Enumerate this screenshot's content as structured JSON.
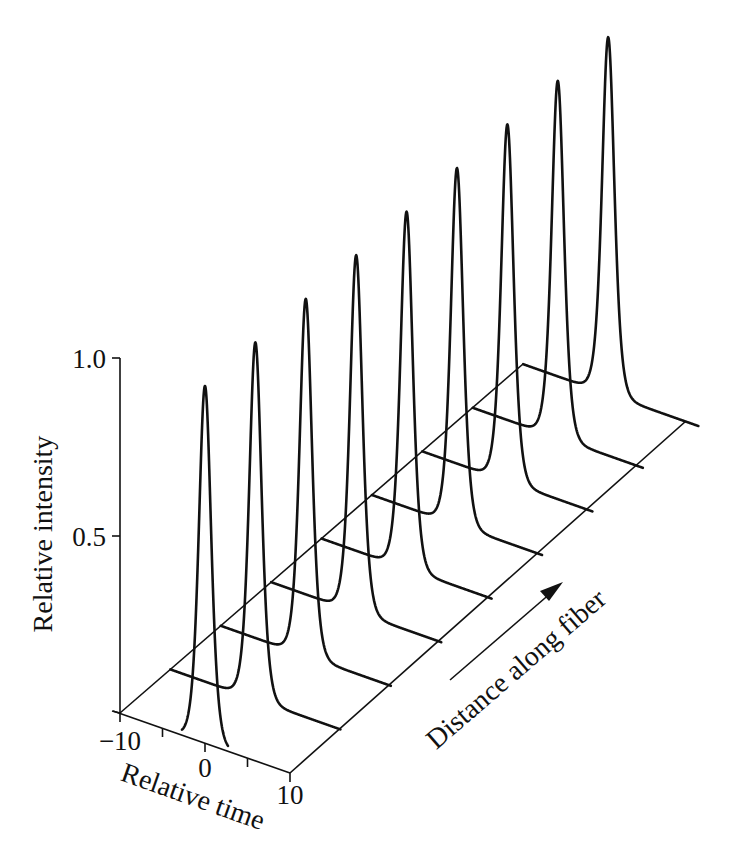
{
  "figure": {
    "y_axis_title": "Relative intensity",
    "x_axis_title": "Relative time",
    "z_axis_title": "Distance along fiber",
    "y_ticks": [
      {
        "value": 1.0,
        "label": "1.0"
      },
      {
        "value": 0.5,
        "label": "0.5"
      }
    ],
    "x_ticks": [
      {
        "value": -10,
        "label": "−10"
      },
      {
        "value": -5,
        "label": ""
      },
      {
        "value": 0,
        "label": "0"
      },
      {
        "value": 5,
        "label": ""
      },
      {
        "value": 10,
        "label": "10"
      }
    ],
    "line_color": "#111111"
  },
  "chart_data": {
    "type": "line",
    "title": "",
    "subtitle": "Soliton pulse propagation: waterfall plot of pulse shape vs. distance along fiber",
    "xlabel": "Relative time",
    "ylabel": "Relative intensity",
    "zlabel": "Distance along fiber",
    "xlim": [
      -10,
      10
    ],
    "ylim": [
      0,
      1.0
    ],
    "grid": false,
    "legend": null,
    "pulse_shape": "sech^2",
    "pulse_fwhm": 1.7,
    "series": [
      {
        "name": "z1",
        "peak_time": 0,
        "peak_intensity": 1.0
      },
      {
        "name": "z2",
        "peak_time": 0,
        "peak_intensity": 1.0
      },
      {
        "name": "z3",
        "peak_time": 0,
        "peak_intensity": 1.0
      },
      {
        "name": "z4",
        "peak_time": 0,
        "peak_intensity": 1.0
      },
      {
        "name": "z5",
        "peak_time": 0,
        "peak_intensity": 1.0
      },
      {
        "name": "z6",
        "peak_time": 0,
        "peak_intensity": 1.0
      },
      {
        "name": "z7",
        "peak_time": 0,
        "peak_intensity": 1.0
      },
      {
        "name": "z8",
        "peak_time": 0,
        "peak_intensity": 1.0
      },
      {
        "name": "z9",
        "peak_time": 0,
        "peak_intensity": 1.0
      }
    ]
  }
}
